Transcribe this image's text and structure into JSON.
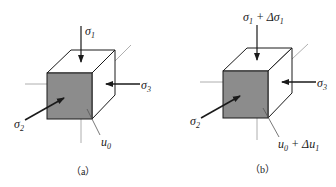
{
  "figure": {
    "panels": [
      {
        "id": "a",
        "caption": "（a）",
        "labels": {
          "sigma1_main": "σ",
          "sigma1_sub": "1",
          "sigma1_extra": "",
          "sigma2_main": "σ",
          "sigma2_sub": "2",
          "sigma3_main": "σ",
          "sigma3_sub": "3",
          "pore_main": "u",
          "pore_sub": "0",
          "pore_extra": ""
        }
      },
      {
        "id": "b",
        "caption": "（b）",
        "labels": {
          "sigma1_main": "σ",
          "sigma1_sub": "1",
          "sigma1_extra": " + Δσ",
          "sigma1_extra_sub": "1",
          "sigma2_main": "σ",
          "sigma2_sub": "2",
          "sigma3_main": "σ",
          "sigma3_sub": "3",
          "pore_main": "u",
          "pore_sub": "0",
          "pore_extra": " + Δu",
          "pore_extra_sub": "1"
        }
      }
    ],
    "colors": {
      "front_face": "#8c8c8c",
      "edges": "#1a1a1a",
      "axis_lines": "#9a9a9a"
    }
  }
}
